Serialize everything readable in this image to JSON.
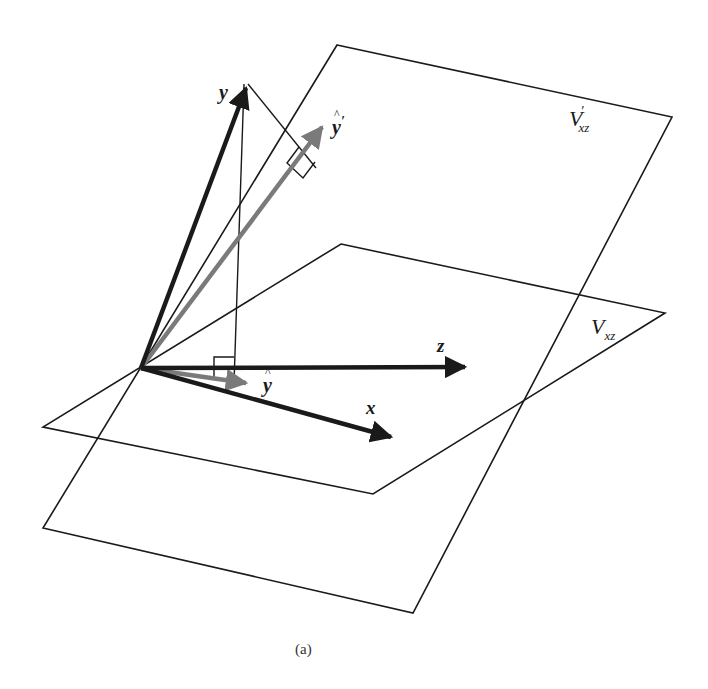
{
  "figure": {
    "caption": "(a)",
    "colors": {
      "line": "#1a1a1a",
      "vector_dark": "#1a1a1a",
      "vector_gray": "#7a7a7a",
      "background": "#ffffff"
    },
    "planes": [
      {
        "id": "V_xz_prime",
        "label_main": "V",
        "label_prime": "′",
        "label_sub": "xz",
        "corners": [
          [
            337,
            45
          ],
          [
            672,
            117
          ],
          [
            413,
            613
          ],
          [
            43,
            528
          ]
        ]
      },
      {
        "id": "V_xz",
        "label_main": "V",
        "label_sub": "xz",
        "corners": [
          [
            341,
            244
          ],
          [
            665,
            313
          ],
          [
            373,
            494
          ],
          [
            43,
            427
          ]
        ]
      }
    ],
    "origin": [
      141,
      368
    ],
    "vectors": [
      {
        "name": "y",
        "label": "y",
        "tip": [
          248,
          80
        ],
        "color": "dark"
      },
      {
        "name": "y_hat_prime",
        "label": "ŷ′",
        "tip": [
          329,
          120
        ],
        "color": "gray"
      },
      {
        "name": "z",
        "label": "z",
        "tip": [
          474,
          367
        ],
        "color": "dark"
      },
      {
        "name": "x",
        "label": "x",
        "tip": [
          400,
          440
        ],
        "color": "dark"
      },
      {
        "name": "y_hat",
        "label": "ŷ",
        "tip": [
          254,
          384
        ],
        "color": "gray"
      }
    ],
    "projection_lines": [
      {
        "from": [
          248,
          84
        ],
        "to": [
          316,
          168
        ],
        "note": "perpendicular from y to ŷ′"
      },
      {
        "from": [
          244,
          84
        ],
        "to": [
          234,
          383
        ],
        "note": "perpendicular from y to ŷ"
      }
    ],
    "labels": {
      "y": "y",
      "y_hat_prime": "y",
      "y_hat": "y",
      "z": "z",
      "x": "x",
      "v_prime_main": "V",
      "v_prime_sub": "xz",
      "v_main": "V",
      "v_sub": "xz"
    }
  }
}
